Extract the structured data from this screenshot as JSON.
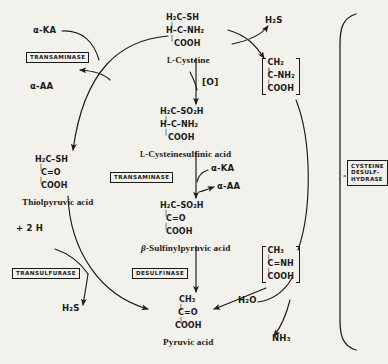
{
  "diagram": {
    "background_color": "#f3f1ec",
    "ink_color": "#1a1a1a"
  },
  "compounds": {
    "cysteine": {
      "name_small_caps": "L",
      "name": "-Cysteine",
      "line1": "H₂C–SH",
      "line2": "H–C–NH₂",
      "line3": "COOH"
    },
    "cysteinesulfinic": {
      "name_small_caps": "L",
      "name": "-Cysteinesulfinic acid",
      "line1": "H₂C–SO₂H",
      "line2": "H–C–NH₂",
      "line3": "COOH"
    },
    "sulfinylpyruvic": {
      "name_italic": "β",
      "name": "-Sulfinylpyruvic acid",
      "line1": "H₂C–SO₂H",
      "line2": "C=O",
      "line3": "COOH"
    },
    "pyruvic": {
      "name": "Pyruvic acid",
      "line1": "CH₃",
      "line2": "C=O",
      "line3": "COOH"
    },
    "thiolpyruvic": {
      "name": "Thiolpyruvic acid",
      "line1": "H₂C–SH",
      "line2": "C=O",
      "line3": "COOH"
    }
  },
  "intermediates": {
    "upper": {
      "line1": "CH₂",
      "line2": "C–NH₂",
      "line3": "COOH",
      "bond": "‖"
    },
    "lower": {
      "line1": "CH₃",
      "line2": "C=NH",
      "line3": "COOH",
      "bond": "‖"
    }
  },
  "enzymes": {
    "transaminase_top": "TRANSAMINASE",
    "transaminase_mid": "TRANSAMINASE",
    "transulfurase": "TRANSULFURASE",
    "desulfinase": "DESULFINASE",
    "cysteine_desulfhydrase_l1": "CYSTEINE",
    "cysteine_desulfhydrase_l2": "DESULF-",
    "cysteine_desulfhydrase_l3": "HYDRASE"
  },
  "cofactors": {
    "alpha_ka_top": "α-KA",
    "alpha_aa_top": "α-AA",
    "alpha_ka_mid": "α-KA",
    "alpha_aa_mid": "α-AA",
    "oxidation": "[O]",
    "plus_two_h": "+ 2 H",
    "h2s_top": "H₂S",
    "h2s_bottom": "H₂S",
    "water": "H₂O",
    "ammonia": "NH₃"
  }
}
